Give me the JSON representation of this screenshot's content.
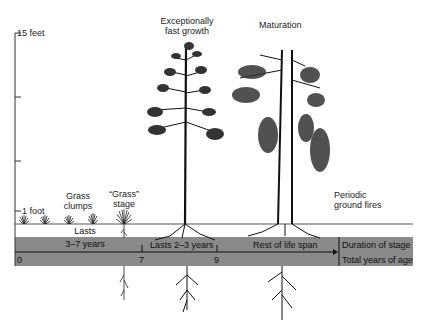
{
  "y_axis": {
    "top_label": "15 feet",
    "bottom_label": "1 foot"
  },
  "stages": [
    {
      "label_line1": "Grass",
      "label_line2": "clumps"
    },
    {
      "label_line1": "“Grass”",
      "label_line2": "stage"
    },
    {
      "label_line1": "Exceptionally",
      "label_line2": "fast growth"
    },
    {
      "label_line1": "Maturation"
    },
    {
      "label_line1": "Periodic",
      "label_line2": "ground fires"
    }
  ],
  "timeline": {
    "duration_1_line1": "Lasts",
    "duration_1_line2": "3–7 years",
    "duration_2": "Lasts 2–3 years",
    "duration_3": "Rest of life span",
    "legend_duration": "Duration of stage",
    "legend_total": "Total years of age",
    "ticks": [
      "0",
      "7",
      "9"
    ]
  },
  "colors": {
    "band": "#8a8a8a",
    "ink": "#1a1a1a",
    "ground": "#555555"
  },
  "icons": [
    "grass-clump-icon",
    "pine-sapling-icon",
    "tall-pine-icon",
    "mature-pine-icon",
    "root-icon"
  ]
}
